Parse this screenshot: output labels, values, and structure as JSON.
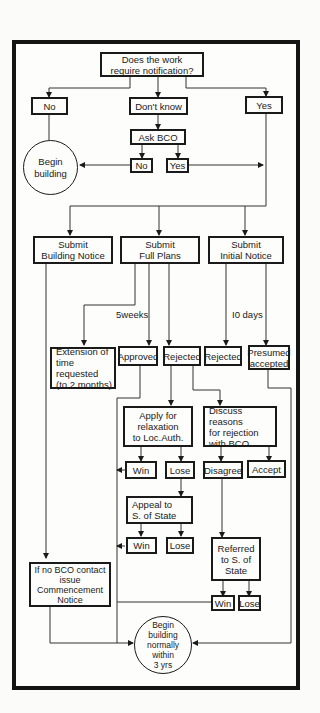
{
  "flowchart": {
    "question": "Does the work\nrequire notification?",
    "answer_no": "No",
    "answer_dont_know": "Don't know",
    "answer_yes": "Yes",
    "ask_bco": "Ask BCO",
    "bco_no": "No",
    "bco_yes": "Yes",
    "begin_building": "Begin\nbuilding",
    "submit_building_notice": "Submit\nBuilding Notice",
    "submit_full_plans": "Submit\nFull Plans",
    "submit_initial_notice": "Submit\nInitial Notice",
    "label_5weeks": "5weeks",
    "label_10days": "I0 days",
    "extension": "Extension of\ntime requested\n(to 2 months)",
    "approved": "Approved",
    "rejected_fp": "Rejected",
    "rejected_in": "Rejected",
    "presumed_accepted": "Presumed\naccepted",
    "apply_relaxation": "Apply for\nrelaxation\nto Loc.Auth.",
    "discuss_reasons": "Discuss reasons\nfor rejection\nwith BCO",
    "relax_win": "Win",
    "relax_lose": "Lose",
    "disagree": "Disagree",
    "accept": "Accept",
    "appeal_state": "Appeal to\nS. of State",
    "appeal_win": "Win",
    "appeal_lose": "Lose",
    "referred_state": "Referred\nto S. of\nState",
    "referred_win": "Win",
    "referred_lose": "Lose",
    "commencement_notice": "If no BCO contact\nissue\nCommencement\nNotice",
    "begin_normally": "Begin\nbuilding\nnormally\nwithin\n3 yrs"
  }
}
